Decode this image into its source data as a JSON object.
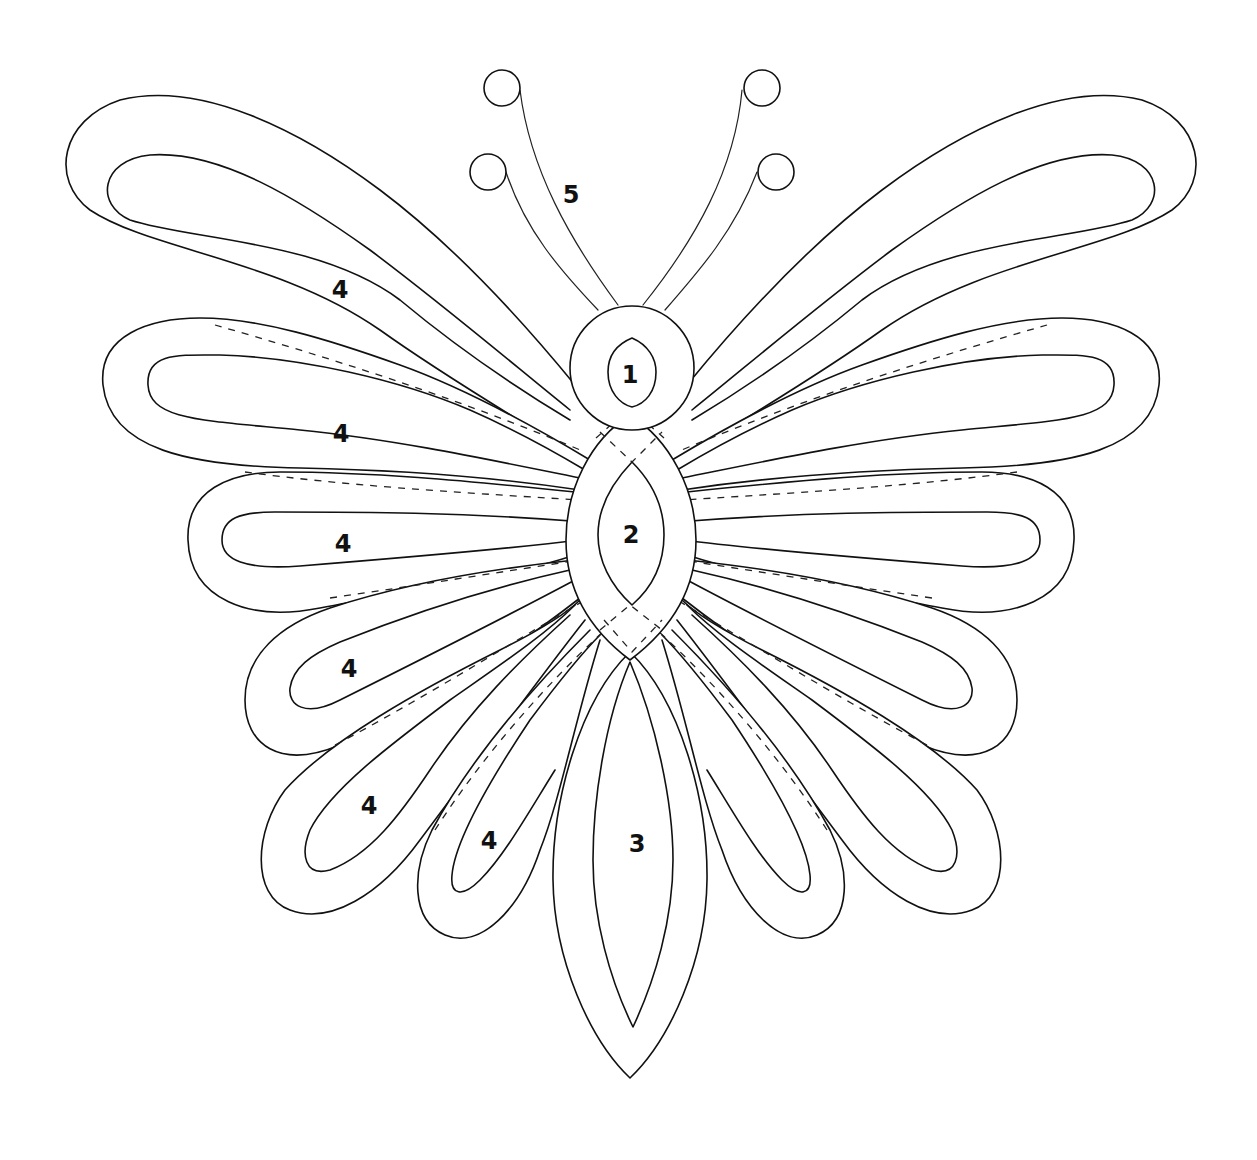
{
  "diagram": {
    "colors": {
      "line": "#111111",
      "background": "#ffffff"
    },
    "labels": {
      "head": "1",
      "thorax": "2",
      "abdomen": "3",
      "antennae": "5",
      "wing_upper": "4",
      "wing_second": "4",
      "wing_middle": "4",
      "wing_fourth": "4",
      "wing_lower": "4",
      "wing_inner": "4"
    },
    "parts": [
      {
        "id": "1",
        "name": "head"
      },
      {
        "id": "2",
        "name": "thorax"
      },
      {
        "id": "3",
        "name": "abdomen"
      },
      {
        "id": "4",
        "name": "wing petals"
      },
      {
        "id": "5",
        "name": "antennae"
      }
    ]
  }
}
